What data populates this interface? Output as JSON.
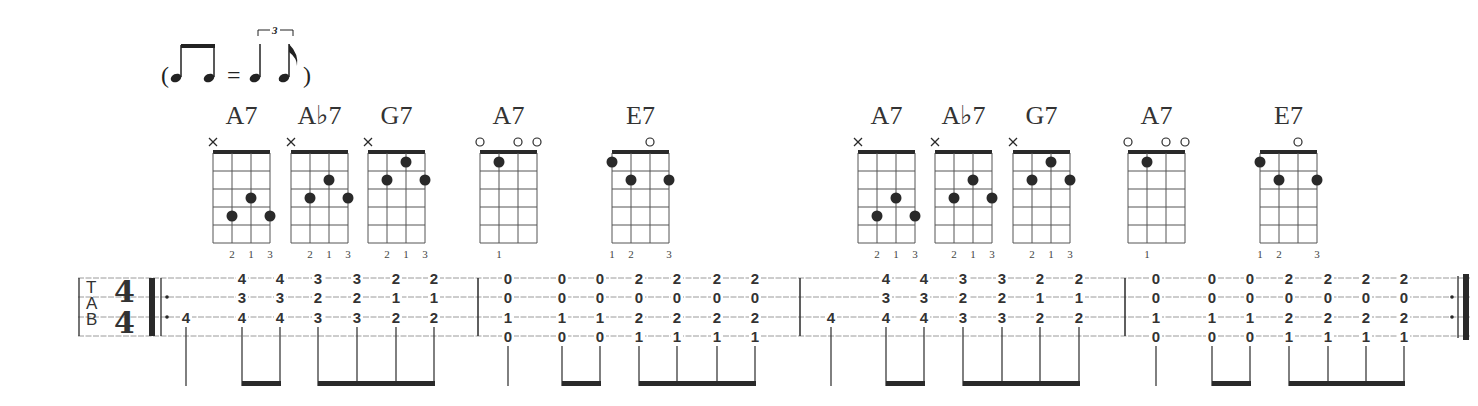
{
  "swing_marking": {
    "open_paren": "(",
    "equals": "=",
    "close_paren": ")",
    "triplet_number": "3",
    "description": "two beamed eighth notes = triplet quarter + eighth"
  },
  "staff": {
    "tab_label": [
      "T",
      "A",
      "B"
    ],
    "time_signature": {
      "top": "4",
      "bottom": "4"
    },
    "strings": 4,
    "repeat_start": true,
    "repeat_end": true
  },
  "chords": [
    {
      "name": "A7",
      "markers": [
        "x",
        "",
        "",
        ""
      ],
      "dots": [
        [
          1,
          4
        ],
        [
          2,
          3
        ],
        [
          3,
          4
        ]
      ],
      "fingers": [
        "",
        "2",
        "1",
        "3"
      ]
    },
    {
      "name": "A♭7",
      "markers": [
        "x",
        "",
        "",
        ""
      ],
      "dots": [
        [
          1,
          3
        ],
        [
          2,
          2
        ],
        [
          3,
          3
        ]
      ],
      "fingers": [
        "",
        "2",
        "1",
        "3"
      ]
    },
    {
      "name": "G7",
      "markers": [
        "x",
        "",
        "",
        ""
      ],
      "dots": [
        [
          1,
          2
        ],
        [
          2,
          1
        ],
        [
          3,
          2
        ]
      ],
      "fingers": [
        "",
        "2",
        "1",
        "3"
      ]
    },
    {
      "name": "A7",
      "markers": [
        "o",
        "",
        "o",
        "o"
      ],
      "dots": [
        [
          1,
          1
        ]
      ],
      "fingers": [
        "",
        "1",
        "",
        ""
      ]
    },
    {
      "name": "E7",
      "markers": [
        "",
        "",
        "o",
        ""
      ],
      "dots": [
        [
          0,
          1
        ],
        [
          1,
          2
        ],
        [
          3,
          2
        ]
      ],
      "fingers": [
        "1",
        "2",
        "",
        "3"
      ]
    },
    {
      "name": "A7",
      "markers": [
        "x",
        "",
        "",
        ""
      ],
      "dots": [
        [
          1,
          4
        ],
        [
          2,
          3
        ],
        [
          3,
          4
        ]
      ],
      "fingers": [
        "",
        "2",
        "1",
        "3"
      ]
    },
    {
      "name": "A♭7",
      "markers": [
        "x",
        "",
        "",
        ""
      ],
      "dots": [
        [
          1,
          3
        ],
        [
          2,
          2
        ],
        [
          3,
          3
        ]
      ],
      "fingers": [
        "",
        "2",
        "1",
        "3"
      ]
    },
    {
      "name": "G7",
      "markers": [
        "x",
        "",
        "",
        ""
      ],
      "dots": [
        [
          1,
          2
        ],
        [
          2,
          1
        ],
        [
          3,
          2
        ]
      ],
      "fingers": [
        "",
        "2",
        "1",
        "3"
      ]
    },
    {
      "name": "A7",
      "markers": [
        "o",
        "",
        "o",
        "o"
      ],
      "dots": [
        [
          1,
          1
        ]
      ],
      "fingers": [
        "",
        "1",
        "",
        ""
      ]
    },
    {
      "name": "E7",
      "markers": [
        "",
        "",
        "o",
        ""
      ],
      "dots": [
        [
          0,
          1
        ],
        [
          1,
          2
        ],
        [
          3,
          2
        ]
      ],
      "fingers": [
        "1",
        "2",
        "",
        "3"
      ]
    }
  ],
  "measures": [
    {
      "notes": [
        [
          "",
          "",
          "4",
          ""
        ],
        [
          "4",
          "3",
          "4",
          ""
        ],
        [
          "4",
          "3",
          "4",
          ""
        ],
        [
          "3",
          "2",
          "3",
          ""
        ],
        [
          "3",
          "2",
          "3",
          ""
        ],
        [
          "2",
          "1",
          "2",
          ""
        ],
        [
          "2",
          "1",
          "2",
          ""
        ]
      ],
      "rhythm": "quarter, 2 beamed eighths, 4 beamed eighths"
    },
    {
      "notes": [
        [
          "0",
          "0",
          "1",
          "0"
        ],
        [
          "0",
          "0",
          "1",
          "0"
        ],
        [
          "0",
          "0",
          "1",
          "0"
        ],
        [
          "2",
          "0",
          "2",
          "1"
        ],
        [
          "2",
          "0",
          "2",
          "1"
        ],
        [
          "2",
          "0",
          "2",
          "1"
        ],
        [
          "2",
          "0",
          "2",
          "1"
        ]
      ],
      "rhythm": "quarter, 2 beamed eighths, 4 beamed eighths"
    },
    {
      "notes": [
        [
          "",
          "",
          "4",
          ""
        ],
        [
          "4",
          "3",
          "4",
          ""
        ],
        [
          "4",
          "3",
          "4",
          ""
        ],
        [
          "3",
          "2",
          "3",
          ""
        ],
        [
          "3",
          "2",
          "3",
          ""
        ],
        [
          "2",
          "1",
          "2",
          ""
        ],
        [
          "2",
          "1",
          "2",
          ""
        ]
      ],
      "rhythm": "quarter, 2 beamed eighths, 4 beamed eighths"
    },
    {
      "notes": [
        [
          "0",
          "0",
          "1",
          "0"
        ],
        [
          "0",
          "0",
          "1",
          "0"
        ],
        [
          "0",
          "0",
          "1",
          "0"
        ],
        [
          "2",
          "0",
          "2",
          "1"
        ],
        [
          "2",
          "0",
          "2",
          "1"
        ],
        [
          "2",
          "0",
          "2",
          "1"
        ],
        [
          "2",
          "0",
          "2",
          "1"
        ]
      ],
      "rhythm": "quarter, 2 beamed eighths, 4 beamed eighths"
    }
  ],
  "colors": {
    "ink": "#2a2a2a",
    "staff_line": "#9a9a9a",
    "background": "#ffffff"
  }
}
